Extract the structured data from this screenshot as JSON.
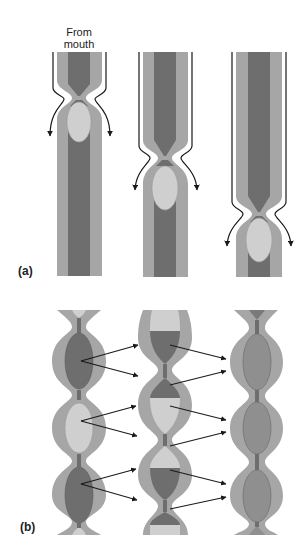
{
  "figure": {
    "annotation_top": "From\nmouth",
    "annotation_line1": "From",
    "annotation_line2": "mouth",
    "panels": [
      {
        "label": "(a)",
        "description": "Peristalsis: a ring of contraction moves a bolus along the tube over three successive stages",
        "stages": [
          {
            "index": 1,
            "constriction_y": 95,
            "bolus_center_y": 120
          },
          {
            "index": 2,
            "constriction_y": 155,
            "bolus_center_y": 188
          },
          {
            "index": 3,
            "constriction_y": 210,
            "bolus_center_y": 238
          }
        ]
      },
      {
        "label": "(b)",
        "description": "Segmentation: contents of each segment are split and mixed into neighbouring segments over three stages",
        "stages": [
          {
            "index": 1,
            "segments": [
              "dark",
              "light",
              "dark"
            ]
          },
          {
            "index": 2,
            "segments": [
              "light/dark",
              "dark/light",
              "light/dark",
              "dark/light"
            ]
          },
          {
            "index": 3,
            "segments": [
              "mixed",
              "mixed",
              "mixed"
            ]
          }
        ]
      }
    ],
    "colors": {
      "wall": "#a6a6a6",
      "lumen_dark": "#6e6e6e",
      "bolus_light": "#cfcfcf",
      "mixed": "#8f8f8f",
      "arrow": "#1a1a1a",
      "outline": "#5a5a5a"
    }
  }
}
